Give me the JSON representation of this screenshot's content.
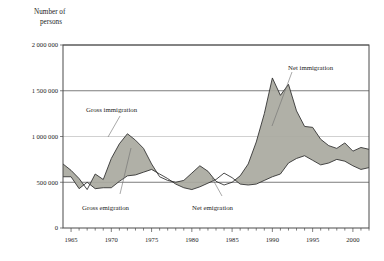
{
  "chart_data": {
    "type": "line",
    "title": "",
    "subtitle": "",
    "ylabel_line1": "Number of",
    "ylabel_line2": "persons",
    "xlabel": "",
    "ylim": [
      0,
      2000000
    ],
    "xlim": [
      1964,
      2002
    ],
    "grid": "horizontal",
    "legend_position": "inline-annotations",
    "ytick_labels": [
      "0",
      "500 000",
      "1 000 000",
      "1 500 000",
      "2 000 000"
    ],
    "ytick_values": [
      0,
      500000,
      1000000,
      1500000,
      2000000
    ],
    "xtick_labels": [
      "1965",
      "1970",
      "1975",
      "1980",
      "1985",
      "1990",
      "1995",
      "2000"
    ],
    "xtick_values": [
      1965,
      1970,
      1975,
      1980,
      1985,
      1990,
      1995,
      2000
    ],
    "x": [
      1964,
      1965,
      1966,
      1967,
      1968,
      1969,
      1970,
      1971,
      1972,
      1973,
      1974,
      1975,
      1976,
      1977,
      1978,
      1979,
      1980,
      1981,
      1982,
      1983,
      1984,
      1985,
      1986,
      1987,
      1988,
      1989,
      1990,
      1991,
      1992,
      1993,
      1994,
      1995,
      1996,
      1997,
      1998,
      1999,
      2000,
      2001,
      2002
    ],
    "series": [
      {
        "name": "Gross immigration",
        "color": "#2a2a2a",
        "values": [
          700000,
          630000,
          540000,
          420000,
          590000,
          530000,
          760000,
          920000,
          1030000,
          960000,
          870000,
          700000,
          560000,
          520000,
          500000,
          520000,
          600000,
          680000,
          620000,
          510000,
          470000,
          500000,
          570000,
          700000,
          940000,
          1250000,
          1640000,
          1450000,
          1570000,
          1280000,
          1110000,
          1100000,
          970000,
          900000,
          870000,
          930000,
          840000,
          880000,
          860000
        ]
      },
      {
        "name": "Gross emigration",
        "color": "#2a2a2a",
        "values": [
          560000,
          560000,
          430000,
          500000,
          430000,
          440000,
          440000,
          510000,
          570000,
          580000,
          610000,
          640000,
          590000,
          540000,
          480000,
          440000,
          420000,
          450000,
          490000,
          530000,
          600000,
          550000,
          480000,
          470000,
          480000,
          520000,
          560000,
          590000,
          710000,
          760000,
          790000,
          740000,
          690000,
          710000,
          750000,
          730000,
          680000,
          640000,
          660000
        ]
      }
    ],
    "annotations": [
      {
        "text": "Gross immigration",
        "x": 1969,
        "y": 1190000
      },
      {
        "text": "Gross emigration",
        "x": 1969,
        "y": 230000
      },
      {
        "text": "Net emigration",
        "x": 1983,
        "y": 260000
      },
      {
        "text": "Net immigration",
        "x": 1993,
        "y": 1690000
      }
    ],
    "band_fill_color": "#a9a9a0"
  }
}
